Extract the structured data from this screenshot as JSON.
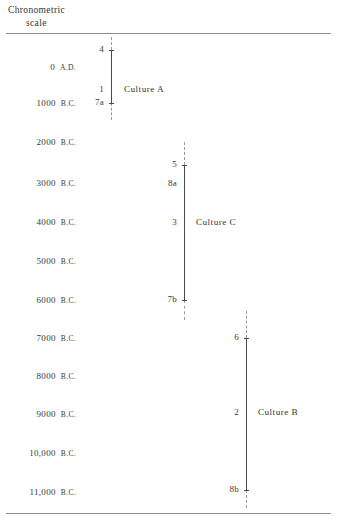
{
  "header": {
    "line1": "Chronometric",
    "line2": "scale"
  },
  "scale": {
    "axis_label": "Chronometric scale",
    "ticks": [
      {
        "value": 0,
        "text": "A.D.  0",
        "era": "A.D.",
        "number": "0",
        "top": 62
      },
      {
        "value": -1000,
        "text": "1000  B.C.",
        "era": "B.C.",
        "number": "1000",
        "top": 98
      },
      {
        "value": -2000,
        "text": "2000  B.C.",
        "era": "B.C.",
        "number": "2000",
        "top": 137
      },
      {
        "value": -3000,
        "text": "3000  B.C.",
        "era": "B.C.",
        "number": "3000",
        "top": 178
      },
      {
        "value": -4000,
        "text": "4000  B.C.",
        "era": "B.C.",
        "number": "4000",
        "top": 217
      },
      {
        "value": -5000,
        "text": "5000  B.C.",
        "era": "B.C.",
        "number": "5000",
        "top": 256
      },
      {
        "value": -6000,
        "text": "6000  B.C.",
        "era": "B.C.",
        "number": "6000",
        "top": 295
      },
      {
        "value": -7000,
        "text": "7000  B.C.",
        "era": "B.C.",
        "number": "7000",
        "top": 333
      },
      {
        "value": -8000,
        "text": "8000  B.C.",
        "era": "B.C.",
        "number": "8000",
        "top": 371
      },
      {
        "value": -9000,
        "text": "9000  B.C.",
        "era": "B.C.",
        "number": "9000",
        "top": 409
      },
      {
        "value": -10000,
        "text": "10,000  B.C.",
        "era": "B.C.",
        "number": "10,000",
        "top": 448
      },
      {
        "value": -11000,
        "text": "11,000  B.C.",
        "era": "B.C.",
        "number": "11,000",
        "top": 487
      }
    ]
  },
  "cultures": [
    {
      "id": "culture-a",
      "name": "Culture A",
      "axis_x": 111,
      "solid_top": 50,
      "solid_bottom": 103,
      "dash_above_top": 37,
      "dash_above_bottom": 50,
      "dash_below_top": 103,
      "dash_below_bottom": 120,
      "name_left": 124,
      "name_top": 84,
      "nodes": [
        {
          "label": "4",
          "top": 44,
          "tick": true
        },
        {
          "label": "1",
          "top": 84,
          "tick": false
        },
        {
          "label": "7a",
          "top": 97,
          "tick": true
        }
      ]
    },
    {
      "id": "culture-c",
      "name": "Culture C",
      "axis_x": 184,
      "solid_top": 165,
      "solid_bottom": 300,
      "dash_above_top": 142,
      "dash_above_bottom": 165,
      "dash_below_top": 300,
      "dash_below_bottom": 320,
      "name_left": 196,
      "name_top": 217,
      "nodes": [
        {
          "label": "5",
          "top": 159,
          "tick": true
        },
        {
          "label": "8a",
          "top": 178,
          "tick": false
        },
        {
          "label": "3",
          "top": 217,
          "tick": false
        },
        {
          "label": "7b",
          "top": 294,
          "tick": true
        }
      ]
    },
    {
      "id": "culture-b",
      "name": "Culture B",
      "axis_x": 246,
      "solid_top": 338,
      "solid_bottom": 490,
      "dash_above_top": 311,
      "dash_above_bottom": 338,
      "dash_below_top": 490,
      "dash_below_bottom": 508,
      "name_left": 258,
      "name_top": 407,
      "nodes": [
        {
          "label": "6",
          "top": 332,
          "tick": true
        },
        {
          "label": "2",
          "top": 407,
          "tick": false
        },
        {
          "label": "8b",
          "top": 484,
          "tick": true
        }
      ]
    }
  ],
  "chart_data": {
    "type": "line",
    "title": "Chronometric scale",
    "xlabel": "",
    "ylabel": "Chronometric scale",
    "ylim": [
      -11500,
      500
    ],
    "yticks": [
      0,
      -1000,
      -2000,
      -3000,
      -4000,
      -5000,
      -6000,
      -7000,
      -8000,
      -9000,
      -10000,
      -11000
    ],
    "ytick_labels": [
      "A.D.  0",
      "1000  B.C.",
      "2000  B.C.",
      "3000  B.C.",
      "4000  B.C.",
      "5000  B.C.",
      "6000  B.C.",
      "7000  B.C.",
      "8000  B.C.",
      "9000  B.C.",
      "10,000  B.C.",
      "11,000  B.C."
    ],
    "grid": false,
    "legend": "none",
    "series": [
      {
        "name": "Culture A",
        "range_start": -1100,
        "range_end": 330,
        "uncertain_extension": true,
        "points": [
          {
            "label": "4",
            "value": 330
          },
          {
            "label": "1",
            "value": -720
          },
          {
            "label": "7a",
            "value": -1060
          }
        ]
      },
      {
        "name": "Culture C",
        "range_start": -6000,
        "range_end": -2850,
        "uncertain_extension": true,
        "points": [
          {
            "label": "5",
            "value": -2850
          },
          {
            "label": "8a",
            "value": -3350
          },
          {
            "label": "3",
            "value": -4350
          },
          {
            "label": "7b",
            "value": -6320
          }
        ]
      },
      {
        "name": "Culture B",
        "range_start": -11000,
        "range_end": -7000,
        "uncertain_extension": true,
        "points": [
          {
            "label": "6",
            "value": -7120
          },
          {
            "label": "2",
            "value": -9050
          },
          {
            "label": "8b",
            "value": -11030
          }
        ]
      }
    ]
  }
}
